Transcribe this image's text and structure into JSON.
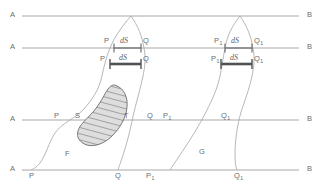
{
  "figure": {
    "background_color": "#ffffff",
    "line_color": "#9a9a9a",
    "curve_color": "#a6a6a6",
    "text_color": "#6c6c6c",
    "bar_color": "#55585a",
    "hatch_color": "#6f6f6f",
    "hatch_fill": "#d9d9d9"
  },
  "horizontal_lines": {
    "left_labels": [
      "A",
      "A",
      "A",
      "A"
    ],
    "right_labels": [
      "B",
      "B",
      "B",
      "B"
    ],
    "y_positions": [
      16,
      48,
      120,
      170
    ]
  },
  "segment_labels": {
    "ds_upper_left": "dS",
    "ds_lower_left": "dS",
    "ds_upper_right": "dS",
    "ds_lower_right": "dS"
  },
  "points": {
    "p_upper_left": "P",
    "q_upper_left": "Q",
    "p_lower_left": "P",
    "q_lower_left": "Q",
    "p1_upper_right": "P",
    "p1_upper_right_sub": "1",
    "q1_upper_right": "Q",
    "q1_upper_right_sub": "1",
    "p1_lower_right": "P",
    "p1_lower_right_sub": "1",
    "q1_lower_right": "Q",
    "q1_lower_right_sub": "1",
    "p_mid": "P",
    "q_mid": "Q",
    "p1_mid": "P",
    "p1_mid_sub": "1",
    "q1_mid": "Q",
    "q1_mid_sub": "1",
    "p_bottom": "P",
    "q_bottom": "Q",
    "p1_bottom": "P",
    "p1_bottom_sub": "1",
    "q1_bottom": "Q",
    "q1_bottom_sub": "1"
  },
  "region_labels": {
    "s_label": "S",
    "t_label": "T",
    "f_label": "F",
    "g_label": "G"
  }
}
